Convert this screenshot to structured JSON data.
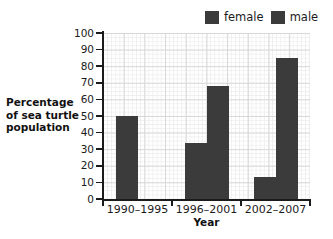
{
  "chart_data": {
    "type": "bar",
    "title": "",
    "xlabel": "Year",
    "ylabel": "Percentage of sea turtle population",
    "ylabel_lines": [
      "Percentage",
      "of sea turtle",
      "population"
    ],
    "categories": [
      "1990–1995",
      "1996–2001",
      "2002–2007"
    ],
    "series": [
      {
        "name": "female",
        "values": [
          50,
          34,
          13
        ],
        "color": "#3b3b3b"
      },
      {
        "name": "male",
        "values": [
          0,
          68,
          85
        ],
        "color": "#3b3b3b"
      }
    ],
    "ylim": [
      0,
      100
    ],
    "ytick_labels": [
      "100",
      "90",
      "80",
      "70",
      "60",
      "50",
      "40",
      "30",
      "20",
      "10",
      "0"
    ],
    "ytick_values": [
      100,
      90,
      80,
      70,
      60,
      50,
      40,
      30,
      20,
      10,
      0
    ],
    "grid": true,
    "legend_position": "top-right",
    "legend_entries": [
      "female",
      "male"
    ]
  },
  "legend": {
    "female_label": "female",
    "male_label": "male"
  },
  "axes": {
    "x_title": "Year",
    "y_title_line1": "Percentage",
    "y_title_line2": "of sea turtle",
    "y_title_line3": "population"
  },
  "colors": {
    "bar": "#3b3b3b",
    "axis": "#1b1b1b",
    "grid_major": "#d8d8d8",
    "grid_minor": "#eeeeee",
    "background": "#ffffff"
  }
}
